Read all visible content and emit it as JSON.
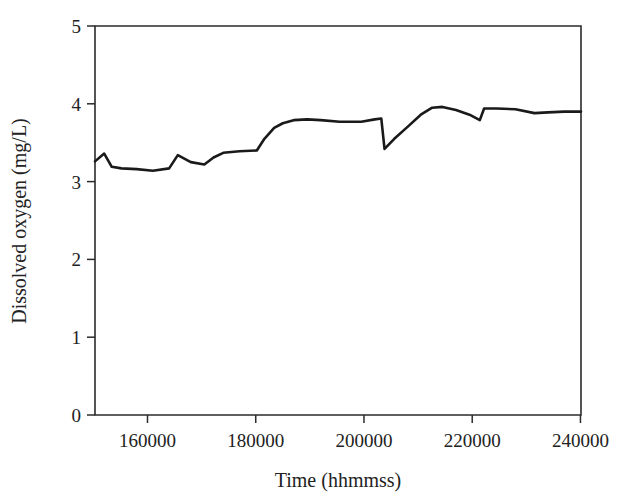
{
  "chart_data": {
    "type": "line",
    "title": "",
    "xlabel": "Time (hhmmss)",
    "ylabel": "Dissolved oxygen (mg/L)",
    "xlim": [
      150300,
      240100
    ],
    "ylim": [
      0,
      5
    ],
    "xticks": [
      160000,
      180000,
      200000,
      220000,
      240000
    ],
    "xticklabels": [
      "160000",
      "180000",
      "200000",
      "220000",
      "240000"
    ],
    "yticks": [
      0,
      1,
      2,
      3,
      4,
      5
    ],
    "yticklabels": [
      "0",
      "1",
      "2",
      "3",
      "4",
      "5"
    ],
    "grid": false,
    "legend": null,
    "series": [
      {
        "name": "Dissolved oxygen",
        "color": "#1a1a1a",
        "x": [
          150300,
          152000,
          153400,
          155200,
          158000,
          161000,
          164000,
          165600,
          168000,
          170500,
          172200,
          174000,
          177000,
          180200,
          181600,
          183400,
          185000,
          187000,
          189500,
          192000,
          195500,
          199500,
          202000,
          203200,
          203800,
          205600,
          208000,
          210500,
          212600,
          214500,
          217000,
          219500,
          221400,
          222200,
          224500,
          228000,
          231500,
          234000,
          237000,
          240100
        ],
        "y": [
          3.26,
          3.36,
          3.19,
          3.17,
          3.16,
          3.14,
          3.17,
          3.34,
          3.25,
          3.22,
          3.31,
          3.37,
          3.39,
          3.4,
          3.55,
          3.69,
          3.75,
          3.79,
          3.8,
          3.79,
          3.77,
          3.77,
          3.8,
          3.81,
          3.42,
          3.55,
          3.7,
          3.86,
          3.95,
          3.96,
          3.92,
          3.86,
          3.79,
          3.94,
          3.94,
          3.93,
          3.88,
          3.89,
          3.9,
          3.9
        ]
      }
    ]
  },
  "axes": {
    "x_title": "Time (hhmmss)",
    "y_title": "Dissolved oxygen (mg/L)"
  }
}
